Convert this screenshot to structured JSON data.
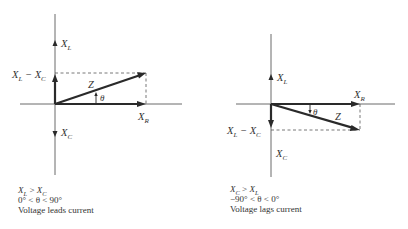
{
  "diagrams": [
    {
      "id": "inductive",
      "labels": {
        "xl": {
          "main": "X",
          "sub": "L"
        },
        "xc": {
          "main": "X",
          "sub": "C"
        },
        "xr": {
          "main": "X",
          "sub": "R"
        },
        "diff": {
          "a": "X",
          "a_sub": "L",
          "minus": " − ",
          "b": "X",
          "b_sub": "C"
        },
        "z": "Z",
        "theta": "θ"
      },
      "caption": {
        "line1": {
          "a": "X",
          "a_sub": "L",
          "op": " > ",
          "b": "X",
          "b_sub": "C"
        },
        "line2": "0° < θ < 90°",
        "line3": "Voltage leads current"
      }
    },
    {
      "id": "capacitive",
      "labels": {
        "xl": {
          "main": "X",
          "sub": "L"
        },
        "xc": {
          "main": "X",
          "sub": "C"
        },
        "xr": {
          "main": "X",
          "sub": "R"
        },
        "diff": {
          "a": "X",
          "a_sub": "L",
          "minus": " − ",
          "b": "X",
          "b_sub": "C"
        },
        "z": "Z",
        "theta": "θ"
      },
      "caption": {
        "line1": {
          "a": "X",
          "a_sub": "C",
          "op": " > ",
          "b": "X",
          "b_sub": "L"
        },
        "line2": "−90° < θ < 0°",
        "line3": "Voltage lags current"
      }
    }
  ]
}
